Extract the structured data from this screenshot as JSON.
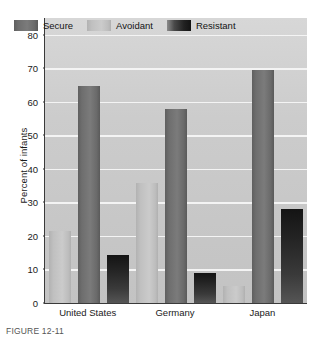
{
  "chart_data": {
    "type": "bar",
    "title": "",
    "xlabel": "",
    "ylabel": "Percent of infants",
    "ylim": [
      0,
      85
    ],
    "yticks": [
      0,
      10,
      20,
      30,
      40,
      50,
      60,
      70,
      80
    ],
    "ytick_labels": [
      "0",
      "10",
      "20",
      "30",
      "40",
      "50",
      "60",
      "70",
      "80"
    ],
    "grid": true,
    "legend_position": "top-left-inside",
    "categories": [
      "United States",
      "Germany",
      "Japan"
    ],
    "series": [
      {
        "name": "Secure",
        "color": "#6e6e6e",
        "values": [
          64.6,
          58.0,
          69.5
        ]
      },
      {
        "name": "Avoidant",
        "color": "#c2c2c2",
        "values": [
          21.4,
          35.7,
          5.0
        ]
      },
      {
        "name": "Resistant",
        "color": "#242424",
        "values": [
          14.2,
          8.9,
          27.9
        ]
      }
    ],
    "bar_order_within_group": [
      "Avoidant",
      "Secure",
      "Resistant"
    ],
    "plot_background": "#cccccc",
    "gridline_color": "#f4f4f4",
    "axis_color": "#3a3a3a"
  },
  "legend": {
    "items": [
      {
        "label": "Secure",
        "swatch": "secure-swatch"
      },
      {
        "label": "Avoidant",
        "swatch": "avoidant-swatch"
      },
      {
        "label": "Resistant",
        "swatch": "resistant-swatch"
      }
    ]
  },
  "axes": {
    "y_title": "Percent of infants"
  },
  "caption": {
    "text": "FIGURE 12-11"
  }
}
